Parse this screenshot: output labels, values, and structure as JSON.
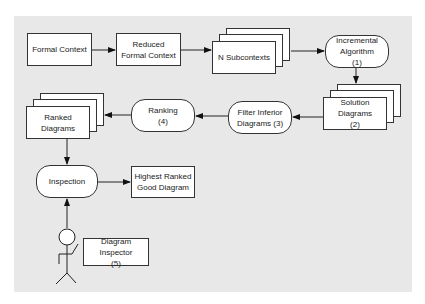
{
  "diagram": {
    "nodes": {
      "formal_context": {
        "label": "Formal Context"
      },
      "reduced_formal_context": {
        "label": "Reduced\nFormal Context"
      },
      "n_subcontexts": {
        "label": "N Subcontexts"
      },
      "incremental_algorithm": {
        "label": "Incremental\nAlgorithm\n(1)"
      },
      "solution_diagrams": {
        "label": "Solution Diagrams\n(2)"
      },
      "filter_inferior": {
        "label": "Filter Inferior\nDiagrams (3)"
      },
      "ranking": {
        "label": "Ranking\n(4)"
      },
      "ranked_diagrams": {
        "label": "Ranked Diagrams"
      },
      "inspection": {
        "label": "Inspection"
      },
      "highest_ranked": {
        "label": "Highest Ranked\nGood Diagram"
      },
      "diagram_inspector": {
        "label": "Diagram Inspector\n(5)"
      }
    },
    "edges": [
      [
        "Formal Context",
        "Reduced Formal Context"
      ],
      [
        "Reduced Formal Context",
        "N Subcontexts"
      ],
      [
        "N Subcontexts",
        "Incremental Algorithm (1)"
      ],
      [
        "Incremental Algorithm (1)",
        "Solution Diagrams (2)"
      ],
      [
        "Solution Diagrams (2)",
        "Filter Inferior Diagrams (3)"
      ],
      [
        "Filter Inferior Diagrams (3)",
        "Ranking (4)"
      ],
      [
        "Ranking (4)",
        "Ranked Diagrams"
      ],
      [
        "Ranked Diagrams",
        "Inspection"
      ],
      [
        "Inspection",
        "Highest Ranked Good Diagram"
      ],
      [
        "Diagram Inspector (5)",
        "Inspection"
      ]
    ],
    "actor": {
      "name": "stick-figure",
      "label_ref": "Diagram Inspector (5)"
    }
  }
}
